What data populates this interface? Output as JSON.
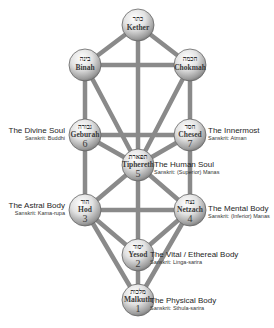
{
  "diagram": {
    "type": "Tree of Life (Kabbalistic Sephiroth)",
    "path_color": "#8a8a8a",
    "sphere_color_light": "#f4f4f4",
    "sphere_color_dark": "#7a7a7a"
  },
  "sephiroth": {
    "kether": {
      "name": "Kether",
      "hebrew": "כתר",
      "number": ""
    },
    "binah": {
      "name": "Binah",
      "hebrew": "בינה",
      "number": ""
    },
    "chokmah": {
      "name": "Chokmah",
      "hebrew": "חכמה",
      "number": ""
    },
    "geburah": {
      "name": "Geburah",
      "hebrew": "גבורה",
      "number": "6"
    },
    "chesed": {
      "name": "Chesed",
      "hebrew": "חסד",
      "number": "7"
    },
    "tiphereth": {
      "name": "Tiphereth",
      "hebrew": "תפארת",
      "number": "5"
    },
    "hod": {
      "name": "Hod",
      "hebrew": "הוד",
      "number": "3"
    },
    "netzach": {
      "name": "Netzach",
      "hebrew": "נצח",
      "number": "4"
    },
    "yesod": {
      "name": "Yesod",
      "hebrew": "יסוד",
      "number": "2"
    },
    "malkuth": {
      "name": "Malkuth",
      "hebrew": "מלכות",
      "number": "1"
    }
  },
  "labels": {
    "divine_soul": {
      "title": "The Divine Soul",
      "sub": "Sanskrit: Buddhi"
    },
    "innermost": {
      "title": "The Innermost",
      "sub": "Sanskrit: Atman"
    },
    "human_soul": {
      "title": "The Human Soul",
      "sub": "Sanskrit: (Superior) Manas"
    },
    "astral_body": {
      "title": "The Astral Body",
      "sub": "Sanskrit: Kama-rupa"
    },
    "mental_body": {
      "title": "The Mental Body",
      "sub": "Sanskrit: (Inferior) Manas"
    },
    "vital_body": {
      "title": "The Vital / Ethereal Body",
      "sub": "Sanskrit: Linga-sarira"
    },
    "physical_body": {
      "title": "The Physical Body",
      "sub": "Sanskrit: Sthula-sarira"
    }
  }
}
